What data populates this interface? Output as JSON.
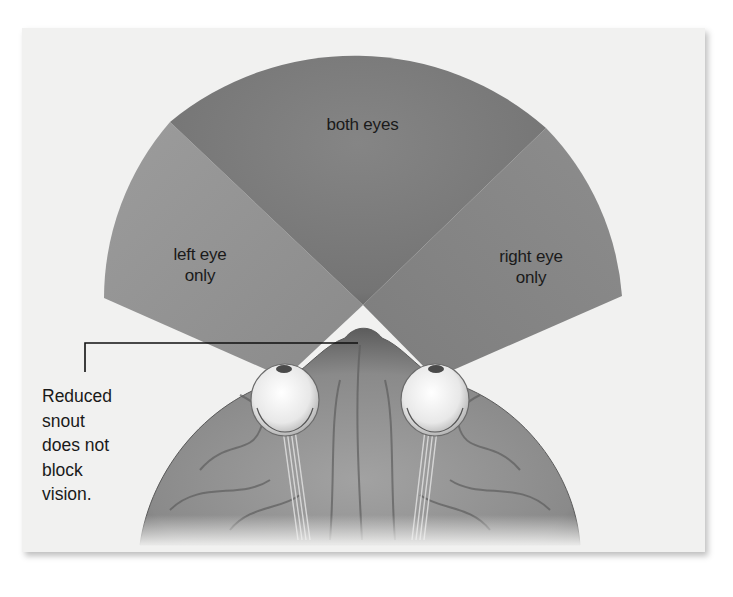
{
  "figure": {
    "regions": {
      "both_eyes": {
        "label": "both eyes"
      },
      "left_eye_only": {
        "label": "left eye\nonly",
        "line1": "left eye",
        "line2": "only"
      },
      "right_eye_only": {
        "label": "right eye\nonly",
        "line1": "right eye",
        "line2": "only"
      }
    },
    "callout": {
      "text": "Reduced\nsnout\ndoes not\nblock\nvision."
    },
    "colors": {
      "panel_background": "#f1f1f0",
      "binocular_field": "#7a7a7a",
      "monocular_field": "#9a9a9a",
      "head": "#8c8c8c",
      "eyeball": "#f4f4f4",
      "text": "#1a1a1a"
    }
  }
}
